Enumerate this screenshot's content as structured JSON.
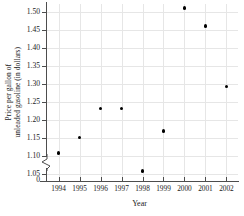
{
  "chart_data": {
    "type": "scatter",
    "title": "",
    "xlabel": "Year",
    "ylabel": "Price per gallon of unleaded gasoline (in dollars)",
    "ylabel_line1": "Price per gallon of",
    "ylabel_line2": "unleaded gasoline (in dollars)",
    "categories": [
      1994,
      1995,
      1996,
      1997,
      1998,
      1999,
      2000,
      2001,
      2002
    ],
    "x": [
      1994,
      1995,
      1996,
      1997,
      1998,
      1999,
      2000,
      2001,
      2002
    ],
    "values": [
      1.11,
      1.152,
      1.233,
      1.233,
      1.059,
      1.171,
      1.511,
      1.461,
      1.294
    ],
    "xtick_labels": [
      "1994",
      "1995",
      "1996",
      "1997",
      "1998",
      "1999",
      "2000",
      "2001",
      "2002"
    ],
    "ytick_labels": [
      "1.50",
      "1.45",
      "1.40",
      "1.35",
      "1.30",
      "1.25",
      "1.20",
      "1.15",
      "1.10",
      "1.05"
    ],
    "ytick_values": [
      1.5,
      1.45,
      1.4,
      1.35,
      1.3,
      1.25,
      1.2,
      1.15,
      1.1,
      1.05
    ],
    "origin_label": "0",
    "ylim": [
      1.05,
      1.52
    ],
    "xlim": [
      1993.5,
      2002.5
    ],
    "grid": true,
    "axis_break": true,
    "legend": "none",
    "marker_color": "#000000",
    "grid_color": "#e6e6e6",
    "axis_color": "#4d4d4d"
  }
}
